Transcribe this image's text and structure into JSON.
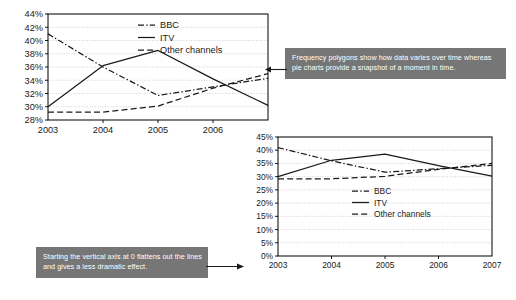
{
  "chart_data": [
    {
      "id": "truncated-axis-chart",
      "type": "line",
      "title": "",
      "xlabel": "",
      "ylabel": "",
      "x": [
        "2003",
        "2004",
        "2005",
        "2006",
        "2007"
      ],
      "xlim": [
        2003,
        2007
      ],
      "ylim": [
        28,
        44
      ],
      "ytick_values": [
        28,
        30,
        32,
        34,
        36,
        38,
        40,
        42,
        44
      ],
      "ytick_labels": [
        "28%",
        "30%",
        "32%",
        "34%",
        "36%",
        "38%",
        "40%",
        "42%",
        "44%"
      ],
      "xtick_labels": [
        "2003",
        "2004",
        "2005",
        "2006"
      ],
      "grid": true,
      "legend_position": "top-center",
      "series": [
        {
          "name": "BBC",
          "style": "dash-dot",
          "values": [
            41.0,
            36.0,
            31.7,
            33.0,
            34.3
          ]
        },
        {
          "name": "ITV",
          "style": "solid",
          "values": [
            30.0,
            36.2,
            38.5,
            34.2,
            30.2
          ]
        },
        {
          "name": "Other channels",
          "style": "dashed",
          "values": [
            29.2,
            29.2,
            30.1,
            32.8,
            35.0
          ]
        }
      ]
    },
    {
      "id": "zero-based-axis-chart",
      "type": "line",
      "title": "",
      "xlabel": "",
      "ylabel": "",
      "x": [
        "2003",
        "2004",
        "2005",
        "2006",
        "2007"
      ],
      "xlim": [
        2003,
        2007
      ],
      "ylim": [
        0,
        45
      ],
      "ytick_values": [
        0,
        5,
        10,
        15,
        20,
        25,
        30,
        35,
        40,
        45
      ],
      "ytick_labels": [
        "0%",
        "5%",
        "10%",
        "15%",
        "20%",
        "25%",
        "30%",
        "35%",
        "40%",
        "45%"
      ],
      "xtick_labels": [
        "2003",
        "2004",
        "2005",
        "2006",
        "2007"
      ],
      "grid": true,
      "legend_position": "center-right",
      "series": [
        {
          "name": "BBC",
          "style": "dash-dot",
          "values": [
            41.0,
            36.0,
            31.7,
            33.0,
            34.3
          ]
        },
        {
          "name": "ITV",
          "style": "solid",
          "values": [
            30.0,
            36.2,
            38.5,
            34.2,
            30.2
          ]
        },
        {
          "name": "Other channels",
          "style": "dashed",
          "values": [
            29.2,
            29.2,
            30.1,
            32.8,
            35.0
          ]
        }
      ]
    }
  ],
  "annotations": {
    "top": {
      "text": "Frequency polygons show how data varies over time whereas pie charts provide a snapshot of a moment in time.",
      "bg_color": "#767676",
      "text_color": "#ffffff"
    },
    "bottom": {
      "text": "Starting the vertical axis at 0 flattens out the lines and gives a less dramatic effect.",
      "bg_color": "#767676",
      "text_color": "#ffffff"
    }
  },
  "colors": {
    "line": "#1a1a1a",
    "grid": "#b4b4b4",
    "axis": "#000000",
    "background": "#ffffff"
  }
}
